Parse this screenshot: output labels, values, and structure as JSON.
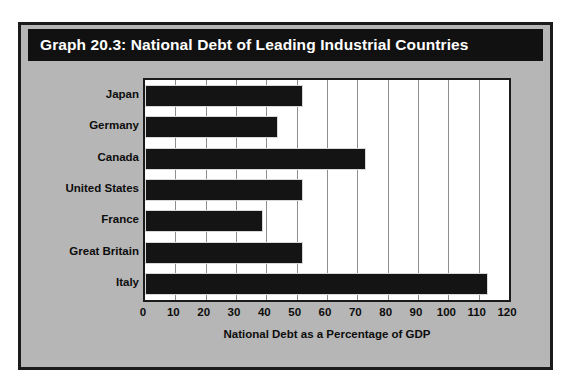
{
  "figure": {
    "title": "Graph 20.3: National Debt of Leading Industrial Countries",
    "panel_color": "#b6b6b6",
    "title_bar_color": "#111111",
    "title_text_color": "#ffffff",
    "border_color": "#1b1b1b",
    "plot_background": "#ffffff",
    "bar_color": "#141414",
    "gridline_color": "#8e8e8e"
  },
  "chart_data": {
    "type": "bar",
    "orientation": "horizontal",
    "title": "Graph 20.3: National Debt of Leading Industrial Countries",
    "categories": [
      "Japan",
      "Germany",
      "Canada",
      "United States",
      "France",
      "Great Britain",
      "Italy"
    ],
    "values": [
      52,
      44,
      73,
      52,
      39,
      52,
      113
    ],
    "xlabel": "National Debt as a Percentage of GDP",
    "ylabel": "",
    "xlim": [
      0,
      120
    ],
    "xticks": [
      0,
      10,
      20,
      30,
      40,
      50,
      60,
      70,
      80,
      90,
      100,
      110,
      120
    ],
    "xtick_labels": [
      "0",
      "10",
      "20",
      "30",
      "40",
      "50",
      "60",
      "70",
      "80",
      "90",
      "100",
      "110",
      "120"
    ],
    "grid": true,
    "grid_axis": "x",
    "legend": false
  }
}
